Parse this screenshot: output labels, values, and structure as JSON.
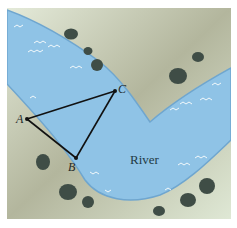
{
  "diagram": {
    "type": "geometry-map",
    "colors": {
      "land_light": "#dfe6d6",
      "land_dark": "#a7ab92",
      "water": "#8fc3e6",
      "water_edge": "#6fa6cf",
      "bush": "#3f4d46",
      "line": "#111111"
    },
    "labels": {
      "river": "River",
      "point_a": "A",
      "point_b": "B",
      "point_c": "C"
    },
    "points": {
      "A": {
        "x": 27,
        "y": 119
      },
      "B": {
        "x": 76,
        "y": 158
      },
      "C": {
        "x": 115,
        "y": 91
      }
    },
    "segments": [
      "AB",
      "BC",
      "CA"
    ]
  }
}
